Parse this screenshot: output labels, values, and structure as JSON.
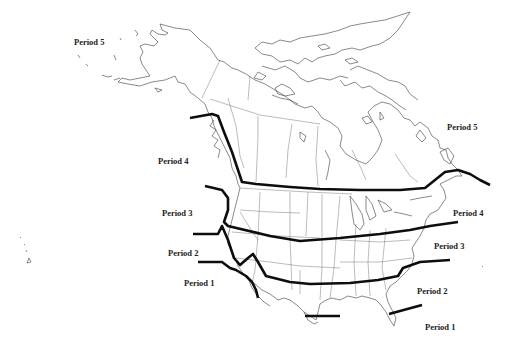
{
  "map": {
    "subject": "North America outline with state and province boundaries",
    "line_color": "#0d0d0d",
    "background": "#ffffff",
    "labels": [
      {
        "id": "alaska-period-5",
        "text": "Period 5",
        "x": 74,
        "y": 38
      },
      {
        "id": "east-period-5",
        "text": "Period 5",
        "x": 447,
        "y": 123
      },
      {
        "id": "west-period-4",
        "text": "Period 4",
        "x": 158,
        "y": 157
      },
      {
        "id": "east-period-4",
        "text": "Period 4",
        "x": 453,
        "y": 209
      },
      {
        "id": "west-period-3",
        "text": "Period 3",
        "x": 162,
        "y": 209
      },
      {
        "id": "east-period-3",
        "text": "Period 3",
        "x": 434,
        "y": 242
      },
      {
        "id": "west-period-2",
        "text": "Period 2",
        "x": 168,
        "y": 249
      },
      {
        "id": "east-period-2",
        "text": "Period 2",
        "x": 417,
        "y": 287
      },
      {
        "id": "west-period-1",
        "text": "Period 1",
        "x": 184,
        "y": 279
      },
      {
        "id": "east-period-1",
        "text": "Period 1",
        "x": 425,
        "y": 323
      }
    ],
    "boundary_lines": [
      {
        "id": "boundary-4-5",
        "separates": [
          "Period 4",
          "Period 5"
        ]
      },
      {
        "id": "boundary-3-4",
        "separates": [
          "Period 3",
          "Period 4"
        ]
      },
      {
        "id": "boundary-2-3",
        "separates": [
          "Period 2",
          "Period 3"
        ]
      },
      {
        "id": "boundary-1-2",
        "separates": [
          "Period 1",
          "Period 2"
        ]
      },
      {
        "id": "boundary-1-2-texas",
        "separates": [
          "Period 1",
          "Period 2"
        ]
      },
      {
        "id": "boundary-1-2-florida",
        "separates": [
          "Period 1",
          "Period 2"
        ]
      }
    ]
  }
}
